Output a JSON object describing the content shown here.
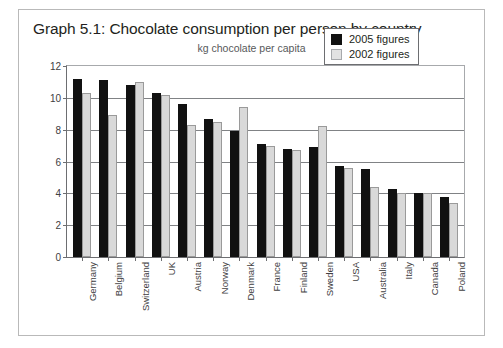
{
  "chart_data": {
    "type": "bar",
    "title": "Graph 5.1: Chocolate consumption per person by country",
    "subtitle": "kg chocolate per capita",
    "xlabel": "",
    "ylabel": "",
    "ylim": [
      0,
      12
    ],
    "yticks": [
      0,
      2,
      4,
      6,
      8,
      10,
      12
    ],
    "grid": true,
    "legend_position": "top-right",
    "categories": [
      "Germany",
      "Belgium",
      "Switzerland",
      "UK",
      "Austria",
      "Norway",
      "Denmark",
      "France",
      "Finland",
      "Sweden",
      "USA",
      "Australia",
      "Italy",
      "Canada",
      "Poland"
    ],
    "series": [
      {
        "name": "2005 figures",
        "color": "#111111",
        "values": [
          11.2,
          11.1,
          10.8,
          10.3,
          9.6,
          8.7,
          7.9,
          7.1,
          6.8,
          6.9,
          5.7,
          5.5,
          4.3,
          4.0,
          3.8
        ]
      },
      {
        "name": "2002 figures",
        "color": "#d9d9d9",
        "values": [
          10.3,
          8.9,
          11.0,
          10.2,
          8.3,
          8.5,
          9.4,
          7.0,
          6.7,
          8.2,
          5.6,
          4.4,
          4.0,
          4.0,
          3.4
        ]
      }
    ]
  },
  "legend": {
    "items": [
      {
        "label": "2005 figures"
      },
      {
        "label": "2002 figures"
      }
    ]
  }
}
